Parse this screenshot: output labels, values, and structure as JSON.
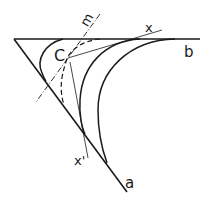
{
  "diagram": {
    "labels": {
      "m": "m",
      "x": "x",
      "b": "b",
      "c": "C",
      "x_prime": "x'",
      "a": "a"
    },
    "colors": {
      "ink": "#1a1a1a",
      "background": "#ffffff"
    }
  }
}
